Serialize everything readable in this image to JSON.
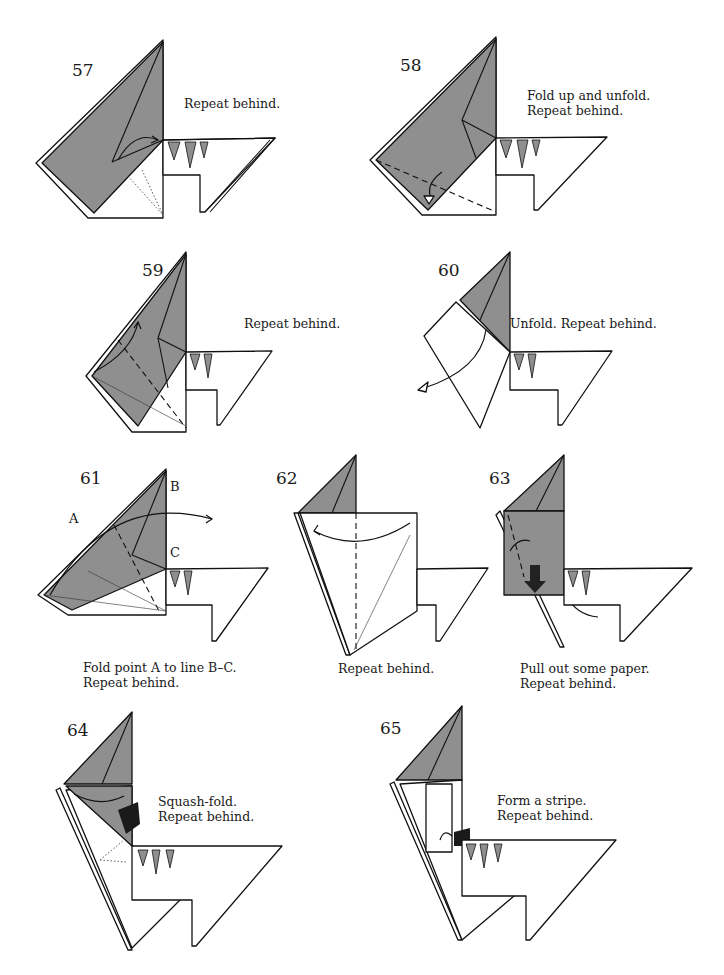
{
  "colors": {
    "paper_colored": "#8f8f8f",
    "paper_white": "#ffffff",
    "line": "#111111"
  },
  "steps": [
    {
      "number": "57",
      "caption": [
        "Repeat behind."
      ]
    },
    {
      "number": "58",
      "caption": [
        "Fold up and unfold.",
        "Repeat behind."
      ]
    },
    {
      "number": "59",
      "caption": [
        "Repeat behind."
      ]
    },
    {
      "number": "60",
      "caption": [
        "Unfold. Repeat behind."
      ]
    },
    {
      "number": "61",
      "caption": [
        "Fold point A to line B–C.",
        "Repeat behind."
      ],
      "labels": {
        "a": "A",
        "b": "B",
        "c": "C"
      }
    },
    {
      "number": "62",
      "caption": [
        "Repeat behind."
      ]
    },
    {
      "number": "63",
      "caption": [
        "Pull out some paper.",
        "Repeat behind."
      ]
    },
    {
      "number": "64",
      "caption": [
        "Squash-fold.",
        "Repeat behind."
      ]
    },
    {
      "number": "65",
      "caption": [
        "Form a stripe.",
        "Repeat behind."
      ]
    }
  ]
}
